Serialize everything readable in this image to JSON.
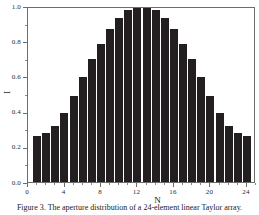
{
  "figure": {
    "caption": "Figure 3. The aperture distribution of a 24-element linear Taylor array."
  },
  "chart_data": {
    "type": "bar",
    "title": "",
    "xlabel": "N",
    "ylabel": "I",
    "xlim": [
      0,
      25
    ],
    "ylim": [
      0.0,
      1.0
    ],
    "grid": false,
    "legend": null,
    "bar_color": "#231f20",
    "frame_color": "#6d6d6d",
    "categories": [
      1,
      2,
      3,
      4,
      5,
      6,
      7,
      8,
      9,
      10,
      11,
      12,
      13,
      14,
      15,
      16,
      17,
      18,
      19,
      20,
      21,
      22,
      23,
      24
    ],
    "values": [
      0.263,
      0.277,
      0.321,
      0.39,
      0.489,
      0.598,
      0.698,
      0.787,
      0.869,
      0.932,
      0.979,
      1.0,
      1.0,
      0.979,
      0.932,
      0.869,
      0.787,
      0.698,
      0.598,
      0.489,
      0.39,
      0.321,
      0.277,
      0.263
    ],
    "x_major_ticks": [
      0,
      4,
      8,
      12,
      16,
      20,
      24
    ],
    "x_major_tick_labels": [
      "0",
      "4",
      "8",
      "12",
      "16",
      "20",
      "24"
    ],
    "x_minor_ticks": [
      1,
      2,
      3,
      5,
      6,
      7,
      9,
      10,
      11,
      13,
      14,
      15,
      17,
      18,
      19,
      21,
      22,
      23,
      25
    ],
    "y_major_ticks": [
      0.0,
      0.2,
      0.4,
      0.6,
      0.8,
      1.0
    ],
    "y_major_tick_labels": [
      "0.0",
      "0.2",
      "0.4",
      "0.6",
      "0.8",
      "1.0"
    ],
    "y_minor_ticks": [
      0.1,
      0.3,
      0.5,
      0.7,
      0.9
    ]
  }
}
